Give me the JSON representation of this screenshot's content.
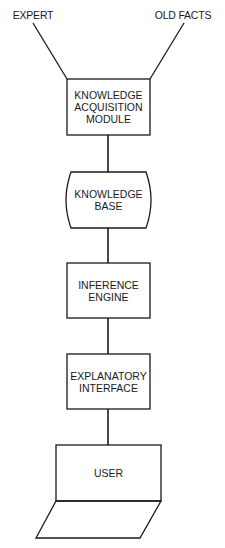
{
  "inputs": {
    "expert": "EXPERT",
    "old_facts": "OLD FACTS"
  },
  "nodes": {
    "knowledge_acquisition": "KNOWLEDGE\nACQUISITION\nMODULE",
    "knowledge_base": "KNOWLEDGE\nBASE",
    "inference_engine": "INFERENCE\nENGINE",
    "explanatory_interface": "EXPLANATORY\nINTERFACE",
    "user": "USER"
  },
  "colors": {
    "stroke": "#1a1a1a",
    "background": "#ffffff"
  }
}
